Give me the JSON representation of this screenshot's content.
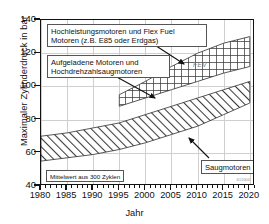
{
  "chart_data": {
    "type": "area",
    "title": "",
    "xlabel": "Jahr",
    "ylabel": "Maximaler Zylinderdruck in bar",
    "xlim": [
      1980,
      2021
    ],
    "ylim": [
      40,
      140
    ],
    "xticks": [
      1980,
      1985,
      1990,
      1995,
      2000,
      2005,
      2010,
      2015,
      2020
    ],
    "yticks": [
      40,
      60,
      80,
      100,
      120,
      140
    ],
    "grid": true,
    "legend_position": "none",
    "series": [
      {
        "name": "Saugmotoren",
        "fill": "diagonal-hatch",
        "x": [
          1980,
          1985,
          1990,
          1995,
          2000,
          2005,
          2010,
          2015,
          2020
        ],
        "upper": [
          70,
          72,
          75,
          78,
          83,
          88,
          93,
          98,
          103
        ],
        "lower": [
          55,
          57,
          59,
          62,
          66,
          71,
          76,
          83,
          90
        ]
      },
      {
        "name": "Aufgeladene Motoren und Hochdrehzahlsaugmotoren",
        "fill": "cross-hatch",
        "x": [
          1995,
          2000,
          2005,
          2010,
          2015,
          2020
        ],
        "upper": [
          95,
          103,
          112,
          120,
          126,
          130
        ],
        "lower": [
          88,
          93,
          98,
          103,
          108,
          112
        ]
      }
    ],
    "annotations": [
      {
        "name": "high-performance-engines",
        "text": "Hochleistungsmotoren und Flex Fuel\nMotoren (z.B. E85 oder Erdgas)",
        "points_to": [
          2008,
          118
        ]
      },
      {
        "name": "charged-engines",
        "text": "Aufgeladene Motoren und\nHochdrehzahlsaugmotoren",
        "points_to": [
          2003,
          96
        ]
      },
      {
        "name": "naturally-aspirated-engines",
        "text": "Saugmotoren",
        "points_to": [
          2008,
          62
        ]
      },
      {
        "name": "mean-value-note",
        "text": "Mittelwert aus 300 Zyklen",
        "points_to": null
      }
    ],
    "watermark": "FEV",
    "source_mark": "612004",
    "colors": {
      "axis": "#111111",
      "grid": "#cfcfcf",
      "hatch": "#333333",
      "background": "#ffffff"
    }
  },
  "axes": {
    "y_title": "Maximaler Zylinderdruck in bar",
    "x_title": "Jahr",
    "y_tick_labels": [
      "140",
      "120",
      "100",
      "80",
      "60",
      "40"
    ],
    "x_tick_labels": [
      "1980",
      "1985",
      "1990",
      "1995",
      "2000",
      "2005",
      "2010",
      "2015",
      "2020"
    ]
  },
  "labels": {
    "high_performance": "Hochleistungsmotoren und Flex Fuel\nMotoren (z.B. E85 oder Erdgas)",
    "charged": "Aufgeladene Motoren und\nHochdrehzahlsaugmotoren",
    "aspirated": "Saugmotoren",
    "mean_note": "Mittelwert aus 300 Zyklen",
    "watermark": "FEV",
    "source_mark": "612004"
  }
}
